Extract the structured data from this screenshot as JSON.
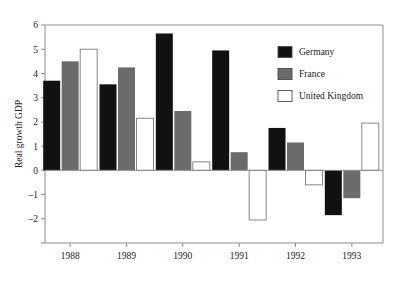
{
  "chart_data": {
    "type": "bar",
    "title": "",
    "xlabel": "",
    "ylabel": "Real growth GDP",
    "categories": [
      "1988",
      "1989",
      "1990",
      "1991",
      "1992",
      "1993"
    ],
    "series": [
      {
        "name": "Germany",
        "color": "#111111",
        "values": [
          3.7,
          3.55,
          5.65,
          4.95,
          1.75,
          -1.85
        ]
      },
      {
        "name": "France",
        "color": "#6b6b6b",
        "values": [
          4.5,
          4.25,
          2.45,
          0.75,
          1.15,
          -1.15
        ]
      },
      {
        "name": "United Kingdom",
        "color": "#ffffff",
        "values": [
          5.0,
          2.15,
          0.35,
          -2.05,
          -0.6,
          1.95
        ]
      }
    ],
    "ylim": [
      -3,
      6
    ],
    "yticks": [
      -3,
      -2,
      -1,
      0,
      1,
      2,
      3,
      4,
      5,
      6
    ],
    "ytick_labels": [
      "",
      "-2",
      "-1",
      "0",
      "1",
      "2",
      "3",
      "4",
      "5",
      "6"
    ],
    "grid": false,
    "legend_position": "top-right",
    "legend_entries": [
      "Germany",
      "France",
      "United Kingdom"
    ]
  },
  "legend": {
    "items": [
      {
        "label": "Germany"
      },
      {
        "label": "France"
      },
      {
        "label": "United Kingdom"
      }
    ]
  },
  "axes": {
    "y_title": "Real growth GDP"
  }
}
